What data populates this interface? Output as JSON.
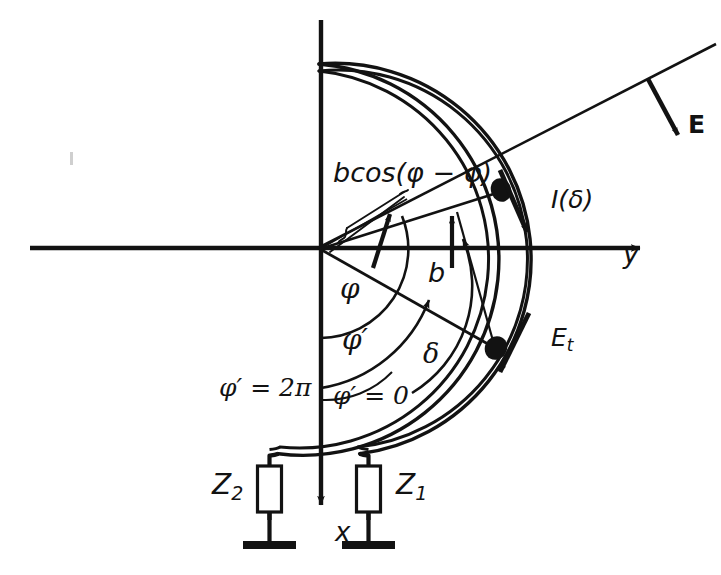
{
  "figure": {
    "kind": "technical-line-diagram",
    "background_color": "#ffffff",
    "ink_color": "#121212",
    "width": 721,
    "height": 575
  },
  "axes": {
    "y_axis_label": "y",
    "x_axis_label": "x",
    "origin_label": ""
  },
  "labels": {
    "projection": "bcos(φ − φ)",
    "current": "I(δ)",
    "e_field": "E",
    "e_tangential_base": "E",
    "e_tangential_sub": "t",
    "radius": "b",
    "angle_phi": "φ",
    "angle_phi_prime": "φ′",
    "angle_delta": "δ",
    "phi_prime_two_pi": "φ′ = 2π",
    "phi_prime_zero": "φ′ = 0",
    "impedance_left_base": "Z",
    "impedance_left_sub": "2",
    "impedance_right_base": "Z",
    "impedance_right_sub": "1"
  },
  "geometry": {
    "circle_center_x": 319,
    "circle_center_y": 260,
    "circle_radius_outer": 196,
    "circle_radius_inner": 189,
    "loop_gap_half_angle_deg": 12,
    "y_axis_tip_x": 648,
    "x_axis_tip_y": 512,
    "e_line_angle_deg": 27,
    "current_point_angle_deg": 22,
    "et_point_angle_deg": -30
  },
  "elements": {
    "ground_symbol_left": "ground",
    "ground_symbol_right": "ground",
    "impedance_box_left": "impedance-box",
    "impedance_box_right": "impedance-box",
    "dot_marker_current": "observation-point-marker",
    "dot_marker_et": "source-point-marker",
    "brace_projection": "measurement-brace"
  },
  "caption_fragment": ""
}
